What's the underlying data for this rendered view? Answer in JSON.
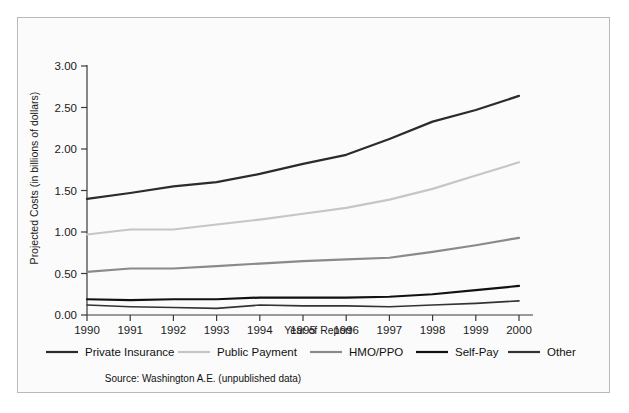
{
  "chart_data": {
    "type": "line",
    "title": "",
    "xlabel": "Year of Report",
    "ylabel": "Projected Costs (in billions of dollars)",
    "x": [
      1990,
      1991,
      1992,
      1993,
      1994,
      1995,
      1996,
      1997,
      1998,
      1999,
      2000
    ],
    "xticklabels": [
      "1990",
      "1991",
      "1992",
      "1993",
      "1994",
      "1995",
      "1996",
      "1997",
      "1998",
      "1999",
      "2000"
    ],
    "yticklabels": [
      "0.00",
      "0.50",
      "1.00",
      "1.50",
      "2.00",
      "2.50",
      "3.00"
    ],
    "yticks": [
      0.0,
      0.5,
      1.0,
      1.5,
      2.0,
      2.5,
      3.0
    ],
    "ylim": [
      0.0,
      3.0
    ],
    "xlim": [
      1990,
      2000
    ],
    "grid": false,
    "legend_position": "below-axes",
    "series": [
      {
        "name": "Private Insurance",
        "color": "#2b2b2b",
        "width": 2.2,
        "values": [
          1.4,
          1.47,
          1.55,
          1.6,
          1.7,
          1.82,
          1.93,
          2.12,
          2.33,
          2.47,
          2.64
        ]
      },
      {
        "name": "Public Payment",
        "color": "#c6c6c6",
        "width": 2.2,
        "values": [
          0.97,
          1.03,
          1.03,
          1.09,
          1.15,
          1.22,
          1.29,
          1.39,
          1.52,
          1.68,
          1.84
        ]
      },
      {
        "name": "HMO/PPO",
        "color": "#8a8a8a",
        "width": 2.2,
        "values": [
          0.52,
          0.56,
          0.56,
          0.59,
          0.62,
          0.65,
          0.67,
          0.69,
          0.76,
          0.84,
          0.93
        ]
      },
      {
        "name": "Self-Pay",
        "color": "#111111",
        "width": 2.2,
        "values": [
          0.19,
          0.18,
          0.19,
          0.19,
          0.21,
          0.21,
          0.21,
          0.22,
          0.25,
          0.3,
          0.35
        ]
      },
      {
        "name": "Other",
        "color": "#333333",
        "width": 1.6,
        "values": [
          0.12,
          0.1,
          0.09,
          0.08,
          0.12,
          0.11,
          0.11,
          0.1,
          0.12,
          0.14,
          0.17
        ]
      }
    ],
    "source_note": "Source: Washington A.E. (unpublished data)"
  }
}
